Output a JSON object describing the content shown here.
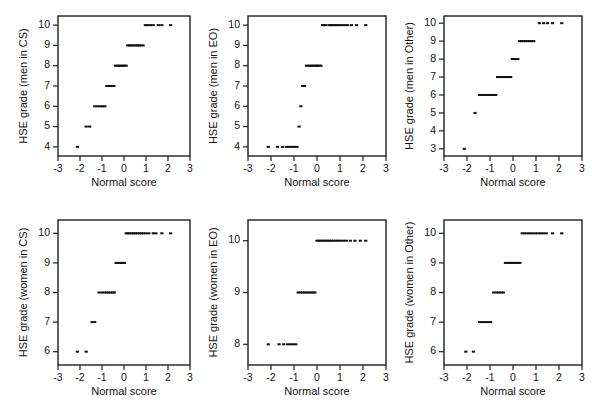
{
  "figure": {
    "background": "#ffffff",
    "marker_color": "#111111",
    "axis_color": "#1f1f1f",
    "rows": 2,
    "cols": 3
  },
  "chart_data": [
    {
      "id": "men-in-cs",
      "type": "scatter",
      "title": "",
      "xlabel": "Normal score",
      "ylabel": "HSE grade (men in CS)",
      "xlim": [
        -3,
        3
      ],
      "ylim": [
        3.55,
        10.45
      ],
      "xticks": [
        -3,
        -2,
        -1,
        0,
        1,
        2,
        3
      ],
      "xticklabels": [
        "-3",
        "-2",
        "-1",
        "0",
        "1",
        "2",
        "3"
      ],
      "yticks": [
        4,
        5,
        6,
        7,
        8,
        9,
        10
      ],
      "yticklabels": [
        "4",
        "5",
        "6",
        "7",
        "8",
        "9",
        "10"
      ],
      "grid": false,
      "legend": "none",
      "x": [
        -2.12,
        -1.72,
        -1.56,
        -1.33,
        -1.2,
        -1.08,
        -0.97,
        -0.87,
        -0.78,
        -0.7,
        -0.62,
        -0.54,
        -0.46,
        -0.39,
        -0.31,
        -0.24,
        -0.17,
        -0.1,
        -0.03,
        0.03,
        0.1,
        0.17,
        0.24,
        0.31,
        0.39,
        0.46,
        0.54,
        0.62,
        0.7,
        0.78,
        0.87,
        0.97,
        1.08,
        1.2,
        1.33,
        1.56,
        1.72,
        2.12
      ],
      "y": [
        4,
        5,
        5,
        6,
        6,
        6,
        6,
        6,
        7,
        7,
        7,
        7,
        7,
        8,
        8,
        8,
        8,
        8,
        8,
        8,
        8,
        9,
        9,
        9,
        9,
        9,
        9,
        9,
        9,
        9,
        9,
        10,
        10,
        10,
        10,
        10,
        10,
        10
      ]
    },
    {
      "id": "men-in-eo",
      "type": "scatter",
      "title": "",
      "xlabel": "Normal score",
      "ylabel": "HSE grade (men in EO)",
      "xlim": [
        -3,
        3
      ],
      "ylim": [
        3.55,
        10.45
      ],
      "xticks": [
        -3,
        -2,
        -1,
        0,
        1,
        2,
        3
      ],
      "xticklabels": [
        "-3",
        "-2",
        "-1",
        "0",
        "1",
        "2",
        "3"
      ],
      "yticks": [
        4,
        5,
        6,
        7,
        8,
        9,
        10
      ],
      "yticklabels": [
        "4",
        "5",
        "6",
        "7",
        "8",
        "9",
        "10"
      ],
      "grid": false,
      "legend": "none",
      "x": [
        -2.12,
        -1.72,
        -1.5,
        -1.33,
        -1.2,
        -1.08,
        -0.97,
        -0.87,
        -0.78,
        -0.7,
        -0.62,
        -0.54,
        -0.46,
        -0.39,
        -0.31,
        -0.24,
        -0.17,
        -0.1,
        -0.03,
        0.03,
        0.1,
        0.17,
        0.24,
        0.31,
        0.39,
        0.54,
        0.62,
        0.7,
        0.78,
        0.87,
        0.97,
        1.08,
        1.2,
        1.33,
        1.5,
        1.72,
        2.12
      ],
      "y": [
        4,
        4,
        4,
        4,
        4,
        4,
        4,
        4,
        5,
        6,
        7,
        7,
        8,
        8,
        8,
        8,
        8,
        8,
        8,
        8,
        8,
        8,
        10,
        10,
        10,
        10,
        10,
        10,
        10,
        10,
        10,
        10,
        10,
        10,
        10,
        10,
        10
      ]
    },
    {
      "id": "men-in-other",
      "type": "scatter",
      "title": "",
      "xlabel": "Normal score",
      "ylabel": "HSE grade (men in Other)",
      "xlim": [
        -3,
        3
      ],
      "ylim": [
        2.6,
        10.4
      ],
      "xticks": [
        -3,
        -2,
        -1,
        0,
        1,
        2,
        3
      ],
      "xticklabels": [
        "-3",
        "-2",
        "-1",
        "0",
        "1",
        "2",
        "3"
      ],
      "yticks": [
        3,
        4,
        5,
        6,
        7,
        8,
        9,
        10
      ],
      "yticklabels": [
        "3",
        "4",
        "5",
        "6",
        "7",
        "8",
        "9",
        "10"
      ],
      "grid": false,
      "legend": "none",
      "x": [
        -2.12,
        -1.65,
        -1.45,
        -1.33,
        -1.22,
        -1.12,
        -1.02,
        -0.93,
        -0.84,
        -0.75,
        -0.67,
        -0.58,
        -0.5,
        -0.42,
        -0.34,
        -0.26,
        -0.18,
        -0.1,
        -0.03,
        0.05,
        0.13,
        0.21,
        0.29,
        0.37,
        0.46,
        0.54,
        0.63,
        0.72,
        0.81,
        0.9,
        1.15,
        1.33,
        1.5,
        1.72,
        2.12
      ],
      "y": [
        3,
        5,
        6,
        6,
        6,
        6,
        6,
        6,
        6,
        6,
        7,
        7,
        7,
        7,
        7,
        7,
        7,
        7,
        8,
        8,
        8,
        8,
        9,
        9,
        9,
        9,
        9,
        9,
        9,
        9,
        10,
        10,
        10,
        10,
        10
      ]
    },
    {
      "id": "women-in-cs",
      "type": "scatter",
      "title": "",
      "xlabel": "Normal score",
      "ylabel": "HSE grade (women in CS)",
      "xlim": [
        -3,
        3
      ],
      "ylim": [
        5.55,
        10.45
      ],
      "xticks": [
        -3,
        -2,
        -1,
        0,
        1,
        2,
        3
      ],
      "xticklabels": [
        "-3",
        "-2",
        "-1",
        "0",
        "1",
        "2",
        "3"
      ],
      "yticks": [
        6,
        7,
        8,
        9,
        10
      ],
      "yticklabels": [
        "6",
        "7",
        "8",
        "9",
        "10"
      ],
      "grid": false,
      "legend": "none",
      "x": [
        -2.12,
        -1.72,
        -1.45,
        -1.33,
        -1.13,
        -1.0,
        -0.89,
        -0.79,
        -0.7,
        -0.61,
        -0.52,
        -0.44,
        -0.36,
        -0.28,
        -0.2,
        -0.13,
        -0.05,
        0.02,
        0.1,
        0.18,
        0.26,
        0.36,
        0.44,
        0.52,
        0.61,
        0.7,
        0.79,
        0.89,
        1.0,
        1.13,
        1.33,
        1.45,
        1.72,
        2.12
      ],
      "y": [
        6,
        6,
        7,
        7,
        8,
        8,
        8,
        8,
        8,
        8,
        8,
        8,
        9,
        9,
        9,
        9,
        9,
        9,
        10,
        10,
        10,
        10,
        10,
        10,
        10,
        10,
        10,
        10,
        10,
        10,
        10,
        10,
        10,
        10
      ]
    },
    {
      "id": "women-in-eo",
      "type": "scatter",
      "title": "",
      "xlabel": "Normal score",
      "ylabel": "HSE grade (women in EO)",
      "xlim": [
        -3,
        3
      ],
      "ylim": [
        7.6,
        10.4
      ],
      "xticks": [
        -3,
        -2,
        -1,
        0,
        1,
        2,
        3
      ],
      "xticklabels": [
        "-3",
        "-2",
        "-1",
        "0",
        "1",
        "2",
        "3"
      ],
      "yticks": [
        8,
        9,
        10
      ],
      "yticklabels": [
        "8",
        "9",
        "10"
      ],
      "grid": false,
      "legend": "none",
      "x": [
        -2.12,
        -1.65,
        -1.45,
        -1.28,
        -1.15,
        -1.03,
        -0.92,
        -0.82,
        -0.72,
        -0.62,
        -0.53,
        -0.44,
        -0.35,
        -0.26,
        -0.17,
        -0.09,
        0.0,
        0.09,
        0.17,
        0.26,
        0.35,
        0.44,
        0.53,
        0.62,
        0.72,
        0.82,
        0.92,
        1.03,
        1.15,
        1.28,
        1.45,
        1.65,
        1.88,
        2.12
      ],
      "y": [
        8,
        8,
        8,
        8,
        8,
        8,
        8,
        9,
        9,
        9,
        9,
        9,
        9,
        9,
        9,
        9,
        10,
        10,
        10,
        10,
        10,
        10,
        10,
        10,
        10,
        10,
        10,
        10,
        10,
        10,
        10,
        10,
        10,
        10
      ]
    },
    {
      "id": "women-in-other",
      "type": "scatter",
      "title": "",
      "xlabel": "Normal score",
      "ylabel": "HSE grade (women in Other)",
      "xlim": [
        -3,
        3
      ],
      "ylim": [
        5.55,
        10.45
      ],
      "xticks": [
        -3,
        -2,
        -1,
        0,
        1,
        2,
        3
      ],
      "xticklabels": [
        "-3",
        "-2",
        "-1",
        "0",
        "1",
        "2",
        "3"
      ],
      "yticks": [
        6,
        7,
        8,
        9,
        10
      ],
      "yticklabels": [
        "6",
        "7",
        "8",
        "9",
        "10"
      ],
      "grid": false,
      "legend": "none",
      "x": [
        -2.05,
        -1.72,
        -1.45,
        -1.32,
        -1.2,
        -1.08,
        -0.97,
        -0.84,
        -0.72,
        -0.62,
        -0.52,
        -0.42,
        -0.33,
        -0.24,
        -0.15,
        -0.06,
        0.03,
        0.12,
        0.21,
        0.3,
        0.4,
        0.5,
        0.6,
        0.72,
        0.84,
        0.97,
        1.08,
        1.2,
        1.32,
        1.45,
        1.72,
        2.12
      ],
      "y": [
        6,
        6,
        7,
        7,
        7,
        7,
        7,
        8,
        8,
        8,
        8,
        8,
        9,
        9,
        9,
        9,
        9,
        9,
        9,
        9,
        10,
        10,
        10,
        10,
        10,
        10,
        10,
        10,
        10,
        10,
        10,
        10
      ]
    }
  ]
}
